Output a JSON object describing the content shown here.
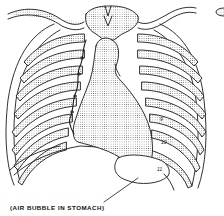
{
  "figure": {
    "caption": "(AIR BUBBLE IN STOMACH)",
    "rib_labels": [
      {
        "text": "9",
        "x": 160,
        "y": 120
      },
      {
        "text": "10",
        "x": 162,
        "y": 143
      },
      {
        "text": "11",
        "x": 158,
        "y": 170
      }
    ],
    "colors": {
      "line": "#1a1a1a",
      "fill_stipple": "#d8d8d8",
      "background": "#ffffff"
    }
  }
}
